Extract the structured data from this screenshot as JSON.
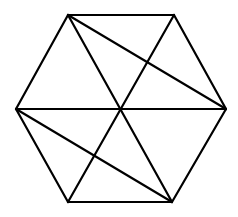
{
  "diagram": {
    "stroke_color": "#000000",
    "background": "#ffffff",
    "vertices": {
      "top_left": [
        68,
        15
      ],
      "top_right": [
        174,
        15
      ],
      "right": [
        226,
        109
      ],
      "bottom_right": [
        172,
        202
      ],
      "bottom_left": [
        68,
        202
      ],
      "left": [
        16,
        109
      ],
      "center": [
        121,
        109
      ]
    },
    "segments": [
      {
        "name": "edge-top",
        "from": "top_left",
        "to": "top_right"
      },
      {
        "name": "edge-upper-right",
        "from": "top_right",
        "to": "right"
      },
      {
        "name": "edge-lower-right",
        "from": "right",
        "to": "bottom_right"
      },
      {
        "name": "edge-bottom",
        "from": "bottom_right",
        "to": "bottom_left"
      },
      {
        "name": "edge-lower-left",
        "from": "bottom_left",
        "to": "left"
      },
      {
        "name": "edge-upper-left",
        "from": "left",
        "to": "top_left"
      },
      {
        "name": "diagonal-left-right",
        "from": "left",
        "to": "right"
      },
      {
        "name": "diagonal-topleft-bottomright",
        "from": "top_left",
        "to": "bottom_right"
      },
      {
        "name": "diagonal-topright-bottomleft",
        "from": "top_right",
        "to": "bottom_left"
      },
      {
        "name": "chord-topleft-right",
        "from": "top_left",
        "to": "right"
      },
      {
        "name": "chord-left-bottomright",
        "from": "left",
        "to": "bottom_right"
      }
    ]
  }
}
